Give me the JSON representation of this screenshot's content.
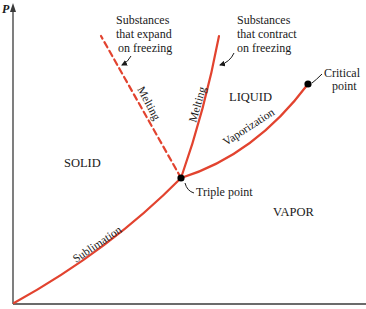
{
  "colors": {
    "curve": "#e2432f",
    "axis": "#3a3a3a",
    "point": "#000000",
    "text": "#1a1a1a"
  },
  "axes": {
    "y_label": "P",
    "x_label": ""
  },
  "regions": {
    "solid": "SOLID",
    "liquid": "LIQUID",
    "vapor": "VAPOR"
  },
  "curves": {
    "sublimation": "Sublimation",
    "vaporization": "Vaporization",
    "melting_expand": "Melting",
    "melting_contract": "Melting"
  },
  "points": {
    "triple": "Triple point",
    "critical_line1": "Critical",
    "critical_line2": "point"
  },
  "annotations": {
    "expand": [
      "Substances",
      "that expand",
      "on freezing"
    ],
    "contract": [
      "Substances",
      "that contract",
      "on freezing"
    ]
  }
}
